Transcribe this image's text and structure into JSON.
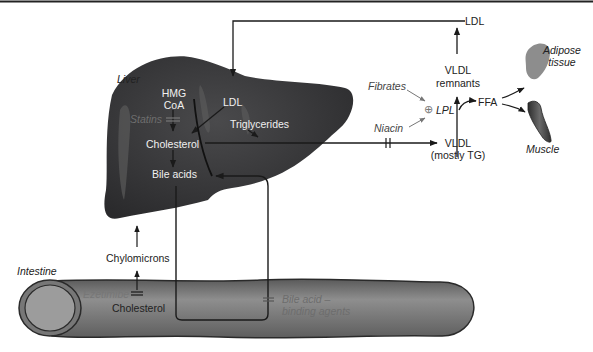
{
  "diagram": {
    "organs": {
      "liver": "Liver",
      "intestine": "Intestine",
      "adipose": "Adipose tissue",
      "adipose_line1": "Adipose",
      "adipose_line2": "tissue",
      "muscle": "Muscle"
    },
    "liver_nodes": {
      "hmg_line1": "HMG",
      "hmg_line2": "CoA",
      "ldl": "LDL",
      "cholesterol": "Cholesterol",
      "bile_acids": "Bile acids",
      "triglycerides": "Triglycerides"
    },
    "plasma_nodes": {
      "ldl_top": "LDL",
      "vldl_remnants_line1": "VLDL",
      "vldl_remnants_line2": "remnants",
      "vldl_line1": "VLDL",
      "vldl_line2": "(mostly TG)",
      "lpl": "LPL",
      "lpl_plus": "⊕",
      "ffa": "FFA"
    },
    "intestine_nodes": {
      "chylomicrons": "Chylomicrons",
      "cholesterol": "Cholesterol"
    },
    "drugs": {
      "statins": "Statins",
      "fibrates": "Fibrates",
      "niacin": "Niacin",
      "ezetimibe": "Ezetimibe",
      "bile_acid_line1": "Bile acid –",
      "bile_acid_line2": "binding agents"
    },
    "colors": {
      "liver": "#3a3a3c",
      "liver_highlight": "#6a6a6a",
      "intestine": "#6e6e6e",
      "intestine_light": "#9a9a9a",
      "adipose": "#8d8d8d",
      "muscle": "#4a4a4a",
      "line": "#1a1a1a"
    }
  }
}
